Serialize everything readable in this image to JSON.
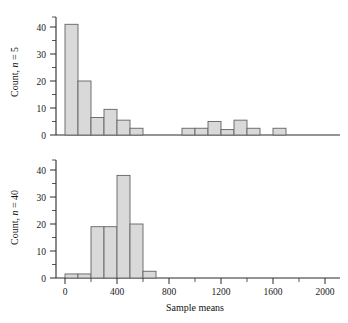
{
  "figure": {
    "width": 348,
    "height": 323,
    "background": "#ffffff",
    "bar_fill": "#d9d9d9",
    "bar_stroke": "#636363",
    "axis_color": "#2b2b2b"
  },
  "axis": {
    "x_title": "Sample means",
    "x_ticks": [
      0,
      400,
      800,
      1200,
      1600,
      2000
    ],
    "x_tick_labels": [
      "0",
      "400",
      "800",
      "1200",
      "1600",
      "2000"
    ],
    "x_min": -150,
    "x_max": 2150,
    "y_ticks": [
      0,
      10,
      20,
      30,
      40
    ],
    "y_tick_labels": [
      "0",
      "10",
      "20",
      "30",
      "40"
    ],
    "y_min": 0,
    "y_max": 46
  },
  "panels": {
    "top": {
      "ylabel_prefix": "Count, ",
      "ylabel_italic": "n",
      "ylabel_suffix": " = 5"
    },
    "bottom": {
      "ylabel_prefix": "Count, ",
      "ylabel_italic": "n",
      "ylabel_suffix": " = 40"
    }
  },
  "chart_data": [
    {
      "type": "bar",
      "title": "",
      "subtitle": "Sampling distribution of sample means, n = 5",
      "xlabel": "Sample means",
      "ylabel": "Count, n = 5",
      "xlim": [
        -150,
        2150
      ],
      "ylim": [
        0,
        46
      ],
      "grid": false,
      "legend": "none",
      "bin_width": 100,
      "bin_starts": [
        0,
        100,
        200,
        300,
        400,
        500,
        900,
        1000,
        1100,
        1200,
        1300,
        1400,
        1600
      ],
      "values": [
        41,
        20,
        6.5,
        9.5,
        5.5,
        2.5,
        2.5,
        2.5,
        5,
        2,
        5.5,
        2.5,
        2.5
      ],
      "categories": [
        "0-100",
        "100-200",
        "200-300",
        "300-400",
        "400-500",
        "500-600",
        "900-1000",
        "1000-1100",
        "1100-1200",
        "1200-1300",
        "1300-1400",
        "1400-1500",
        "1600-1700"
      ],
      "xtick_values": [
        0,
        400,
        800,
        1200,
        1600,
        2000
      ],
      "ytick_values": [
        0,
        10,
        20,
        30,
        40
      ]
    },
    {
      "type": "bar",
      "title": "",
      "subtitle": "Sampling distribution of sample means, n = 40",
      "xlabel": "Sample means",
      "ylabel": "Count, n = 40",
      "xlim": [
        -150,
        2150
      ],
      "ylim": [
        0,
        46
      ],
      "grid": false,
      "legend": "none",
      "bin_width": 100,
      "bin_starts": [
        0,
        100,
        200,
        300,
        400,
        500,
        600
      ],
      "values": [
        1.5,
        1.5,
        19,
        19,
        38,
        20,
        2.5
      ],
      "categories": [
        "0-100",
        "100-200",
        "200-300",
        "300-400",
        "400-500",
        "500-600",
        "600-700"
      ],
      "xtick_values": [
        0,
        400,
        800,
        1200,
        1600,
        2000
      ],
      "ytick_values": [
        0,
        10,
        20,
        30,
        40
      ]
    }
  ]
}
